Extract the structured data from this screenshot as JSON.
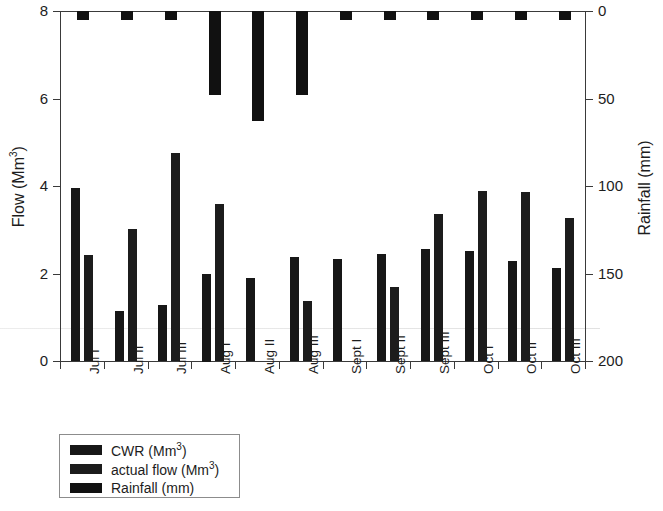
{
  "chart_data": {
    "type": "bar",
    "title": "",
    "subtitle": "",
    "categories": [
      "Jul I",
      "Jul II",
      "Jul III",
      "Aug I",
      "Aug II",
      "Aug III",
      "Sept I",
      "Sept II",
      "Sept III",
      "Oct I",
      "Oct II",
      "Oct III"
    ],
    "xlabel": "",
    "ylabel": "Flow (Mm3)",
    "ylabel_right": "Rainfall (mm)",
    "ylim": [
      0,
      8
    ],
    "ylim_right": [
      200,
      0
    ],
    "y_ticks": [
      0,
      2,
      4,
      6,
      8
    ],
    "y_ticks_right": [
      0,
      50,
      100,
      150,
      200
    ],
    "grid": false,
    "legend_position": "below-left",
    "series": [
      {
        "name": "CWR (Mm3)",
        "axis": "left",
        "unit": "Mm3",
        "color": "#171717",
        "values": [
          3.95,
          1.15,
          1.27,
          2.0,
          1.89,
          2.37,
          2.34,
          2.44,
          2.57,
          2.52,
          2.28,
          2.12
        ]
      },
      {
        "name": "actual flow (Mm3)",
        "axis": "left",
        "unit": "Mm3",
        "color": "#1c1c1c",
        "values": [
          2.43,
          3.01,
          4.75,
          3.58,
          null,
          1.38,
          null,
          1.7,
          3.37,
          3.88,
          3.87,
          3.26
        ]
      },
      {
        "name": "Rainfall (mm)",
        "axis": "right",
        "unit": "mm",
        "color": "#111111",
        "inverted": true,
        "values": [
          0,
          5,
          5,
          48,
          63,
          48,
          0,
          0,
          0,
          5,
          5,
          0
        ]
      }
    ]
  },
  "axes": {
    "left": {
      "title_main": "Flow (Mm",
      "title_sup": "3",
      "title_tail": ")",
      "ticks": [
        "8",
        "6",
        "4",
        "2",
        "0"
      ]
    },
    "right": {
      "title": "Rainfall (mm)",
      "ticks": [
        "0",
        "50",
        "100",
        "150",
        "200"
      ]
    },
    "bottom": {
      "categories": [
        "Jul I",
        "Jul II",
        "Jul III",
        "Aug I",
        "Aug II",
        "Aug III",
        "Sept I",
        "Sept II",
        "Sept III",
        "Oct I",
        "Oct II",
        "Oct III"
      ]
    }
  },
  "legend": {
    "items": [
      {
        "label_main": "CWR (Mm",
        "label_sup": "3",
        "label_tail": ")",
        "color": "#171717"
      },
      {
        "label_main": "actual flow (Mm",
        "label_sup": "3",
        "label_tail": ")",
        "color": "#1c1c1c"
      },
      {
        "label_main": "Rainfall (mm)",
        "label_sup": "",
        "label_tail": "",
        "color": "#111111"
      }
    ]
  }
}
